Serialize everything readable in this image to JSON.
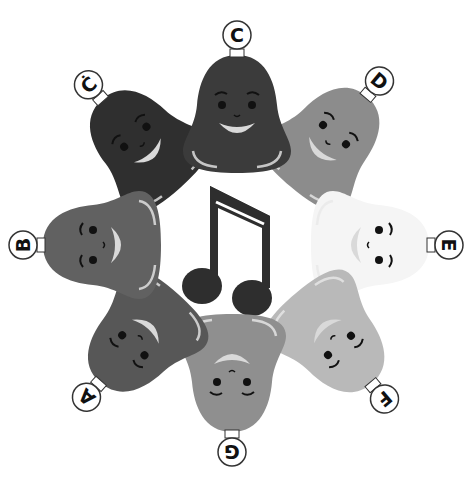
{
  "illustration": {
    "description": "Eight smiling handbells arranged in a circle around a beamed eighth-note symbol",
    "center_symbol": "beamed-eighth-notes-icon",
    "bells": [
      {
        "note": "C",
        "label": "C",
        "color": "#3b3b3b",
        "cx": 237,
        "cy": 112,
        "rotate": 0
      },
      {
        "note": "D",
        "label": "D",
        "color": "#8c8c8c",
        "cx": 330,
        "cy": 140,
        "rotate": 40
      },
      {
        "note": "E",
        "label": "E",
        "color": "#f5f5f5",
        "cx": 372,
        "cy": 245,
        "rotate": 90
      },
      {
        "note": "F",
        "label": "F",
        "color": "#b9b9b9",
        "cx": 335,
        "cy": 340,
        "rotate": 140
      },
      {
        "note": "G",
        "label": "G",
        "color": "#8f8f8f",
        "cx": 232,
        "cy": 375,
        "rotate": 180
      },
      {
        "note": "A",
        "label": "A",
        "color": "#575757",
        "cx": 138,
        "cy": 340,
        "rotate": 222
      },
      {
        "note": "B",
        "label": "B",
        "color": "#616161",
        "cx": 100,
        "cy": 245,
        "rotate": 270
      },
      {
        "note": "C'",
        "label": "Ċ",
        "color": "#2f2f2f",
        "cx": 140,
        "cy": 142,
        "rotate": 318
      }
    ]
  },
  "colors": {
    "background": "#ffffff",
    "note_symbol": "#2e2e2e",
    "label_circle_fill": "#ffffff",
    "label_circle_stroke": "#333333",
    "face_features": "#111111",
    "mouth_fill": "#d9d9d9"
  }
}
